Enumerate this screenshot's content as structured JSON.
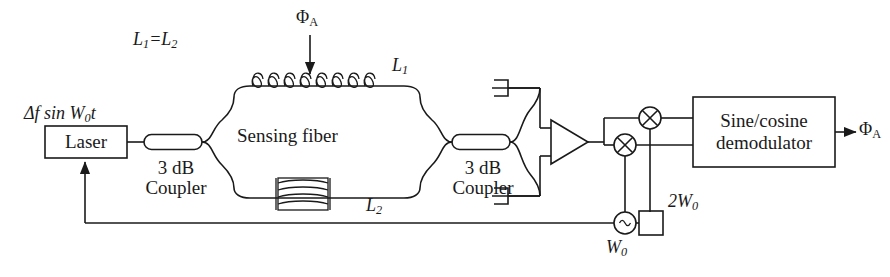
{
  "figure": {
    "type": "fiber-optic-interferometer-block-diagram",
    "background_color": "#ffffff",
    "line_color": "#1a1a1a"
  },
  "labels": {
    "laser_drive": "Δf sin W",
    "laser_drive_sub": "0",
    "laser_drive_tail": "t",
    "path_equality": "L",
    "path_equality_sub1": "1",
    "path_equality_mid": "=L",
    "path_equality_sub2": "2",
    "phi_a_input": "Φ",
    "phi_a_input_sub": "A",
    "phi_a_output": "Φ",
    "phi_a_output_sub": "A",
    "arm_upper": "L",
    "arm_upper_sub": "1",
    "arm_lower": "L",
    "arm_lower_sub": "2",
    "osc_freq": "W",
    "osc_freq_sub": "0",
    "doubler_freq": "2W",
    "doubler_freq_sub": "0"
  },
  "blocks": {
    "laser": {
      "label": "Laser"
    },
    "coupler_left": {
      "line1": "3 dB",
      "line2": "Coupler"
    },
    "coupler_right": {
      "line1": "3 dB",
      "line2": "Coupler"
    },
    "sensing_fiber": {
      "label": "Sensing fiber"
    },
    "demodulator": {
      "line1": "Sine/cosine",
      "line2": "demodulator"
    }
  },
  "components": {
    "oscillator": {
      "symbol": "~",
      "name": "local-oscillator"
    },
    "frequency_doubler": {
      "name": "frequency-doubler"
    },
    "mixer_upper": {
      "symbol": "⊗",
      "name": "mixer-upper"
    },
    "mixer_lower": {
      "symbol": "⊗",
      "name": "mixer-lower"
    },
    "amplifier": {
      "name": "differential-amplifier"
    },
    "detector_upper": {
      "name": "photodetector-upper"
    },
    "detector_lower": {
      "name": "photodetector-lower"
    },
    "coil_top": {
      "name": "sensing-coil-helix"
    },
    "coil_bottom": {
      "name": "reference-coil-spool"
    }
  }
}
